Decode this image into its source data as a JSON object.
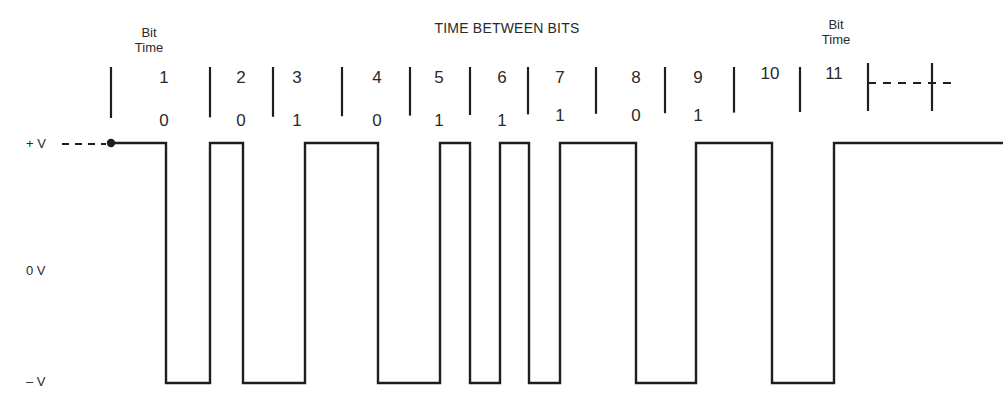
{
  "diagram": {
    "title": "TIME BETWEEN BITS",
    "bit_time_left": {
      "line1": "Bit",
      "line2": "Time",
      "x": 149
    },
    "bit_time_right": {
      "line1": "Bit",
      "line2": "Time",
      "x": 836
    },
    "voltage_labels": {
      "plus": "+ V",
      "zero": "0 V",
      "minus": "– V"
    },
    "levels": {
      "high_y": 143,
      "low_y": 383
    },
    "ticks_x": [
      111,
      210,
      273,
      342,
      410,
      470,
      528,
      596,
      665,
      734,
      800,
      868,
      932
    ],
    "continuation": {
      "from_x": 868,
      "to_x": 954,
      "y": 83
    },
    "bits": [
      {
        "index": "1",
        "value": "0",
        "x": 164
      },
      {
        "index": "2",
        "value": "0",
        "x": 241
      },
      {
        "index": "3",
        "value": "1",
        "x": 297
      },
      {
        "index": "4",
        "value": "0",
        "x": 377
      },
      {
        "index": "5",
        "value": "1",
        "x": 439
      },
      {
        "index": "6",
        "value": "1",
        "x": 502
      },
      {
        "index": "7",
        "value": "1",
        "x": 560
      },
      {
        "index": "8",
        "value": "0",
        "x": 636
      },
      {
        "index": "9",
        "value": "1",
        "x": 698
      },
      {
        "index": "10",
        "value": "",
        "x": 770
      },
      {
        "index": "11",
        "value": "",
        "x": 834
      }
    ],
    "waveform_edges_x": [
      111,
      166,
      210,
      243,
      305,
      378,
      440,
      470,
      500,
      529,
      560,
      636,
      696,
      772,
      834,
      1003
    ],
    "colors": {
      "line": "#1e1e1e",
      "text": "#2a2a2a",
      "background": "#ffffff"
    }
  }
}
